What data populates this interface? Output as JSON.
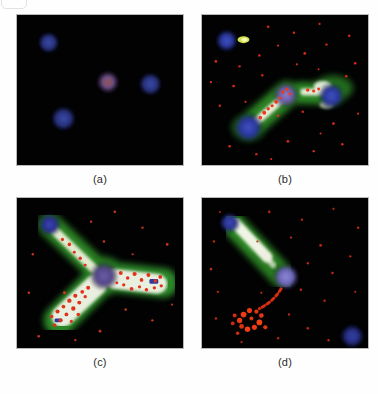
{
  "figure": {
    "type": "fluorescence-micrograph-panel-figure",
    "panel_count": 4,
    "layout": "2x2 grid",
    "background_color": "#ffffff",
    "field_background_color": "#020203",
    "channels": [
      {
        "name": "DAPI / nuclei",
        "color": "#2b3486",
        "role": "nucleus"
      },
      {
        "name": "GFP / cytoplasm",
        "color": "#2f8f2a",
        "role": "cell body"
      },
      {
        "name": "Texas Red / puncta",
        "color": "#e62718",
        "role": "punctate signal"
      },
      {
        "name": "Merged saturated",
        "color": "#fdfdf3",
        "role": "overlap"
      }
    ]
  },
  "panels": [
    {
      "id": "a",
      "caption": "(a)",
      "name": "panel-a",
      "description": "Four rounded nuclei on black field, no filamentous signal",
      "nuclei": [
        {
          "cx": 32,
          "cy": 28,
          "r": 11,
          "color": "#27306f",
          "tone": "blue"
        },
        {
          "cx": 47,
          "cy": 105,
          "r": 13,
          "color": "#232c73",
          "tone": "blue"
        },
        {
          "cx": 92,
          "cy": 68,
          "r": 12,
          "color": "#6a4f80",
          "tone": "violet"
        },
        {
          "cx": 135,
          "cy": 70,
          "r": 12,
          "color": "#25307a",
          "tone": "blue"
        }
      ],
      "red_puncta": [],
      "filaments": []
    },
    {
      "id": "b",
      "caption": "(b)",
      "name": "panel-b",
      "description": "Two elongated cells with green envelopes, bright merged cores and scattered red puncta; violet nucleus at junction",
      "nuclei": [
        {
          "cx": 25,
          "cy": 26,
          "r": 11,
          "color": "#2a3a93",
          "tone": "blue"
        },
        {
          "cx": 47,
          "cy": 114,
          "r": 15,
          "color": "#2a3a9b",
          "tone": "blue"
        },
        {
          "cx": 85,
          "cy": 81,
          "r": 13,
          "color": "#6e63ab",
          "tone": "violet"
        },
        {
          "cx": 131,
          "cy": 82,
          "r": 13,
          "color": "#2a3a9b",
          "tone": "blue"
        }
      ],
      "green_spot": {
        "cx": 42,
        "cy": 25,
        "color": "#cfe04a"
      },
      "red_puncta_count": 40,
      "filaments": [
        {
          "from": [
            47,
            114
          ],
          "to": [
            85,
            81
          ],
          "width": 17
        },
        {
          "from": [
            100,
            79
          ],
          "to": [
            131,
            80
          ],
          "width": 14
        }
      ]
    },
    {
      "id": "c",
      "caption": "(c)",
      "name": "panel-c",
      "description": "Y-shaped / bipolar cell with thick bright arms densely filled with red puncta, central violet nucleus",
      "nuclei": [
        {
          "cx": 33,
          "cy": 27,
          "r": 11,
          "color": "#2b2f86",
          "tone": "blue"
        },
        {
          "cx": 88,
          "cy": 79,
          "r": 14,
          "color": "#5c4f93",
          "tone": "violet"
        },
        {
          "cx": 139,
          "cy": 86,
          "r": 6,
          "color": "#2f3b9c",
          "tone": "blue"
        }
      ],
      "red_puncta_count": 55,
      "filaments": [
        {
          "from": [
            33,
            27
          ],
          "to": [
            88,
            79
          ],
          "width": 15
        },
        {
          "from": [
            88,
            79
          ],
          "to": [
            43,
            124
          ],
          "width": 22
        },
        {
          "from": [
            88,
            79
          ],
          "to": [
            146,
            86
          ],
          "width": 20
        }
      ]
    },
    {
      "id": "d",
      "caption": "(d)",
      "name": "panel-d",
      "description": "Single bright elongated process from blue nucleus, isolated violet nucleus and a detached arc-shaped cluster of red puncta",
      "nuclei": [
        {
          "cx": 28,
          "cy": 25,
          "r": 10,
          "color": "#2b3594",
          "tone": "blue"
        },
        {
          "cx": 85,
          "cy": 80,
          "r": 13,
          "color": "#6f6bbd",
          "tone": "violet"
        },
        {
          "cx": 152,
          "cy": 138,
          "r": 11,
          "color": "#4554a8",
          "tone": "blue"
        }
      ],
      "red_puncta_count": 45,
      "red_cluster": {
        "cx": 58,
        "cy": 115,
        "shape": "arc",
        "color": "#ec3a14"
      },
      "filaments": [
        {
          "from": [
            28,
            25
          ],
          "to": [
            74,
            72
          ],
          "width": 13
        }
      ]
    }
  ]
}
